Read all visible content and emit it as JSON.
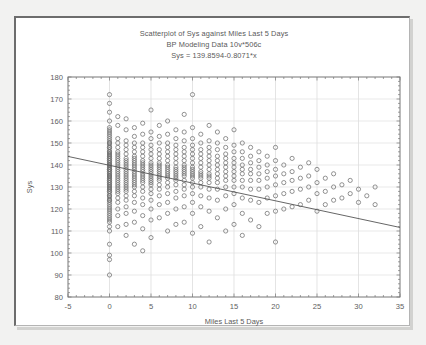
{
  "window": {
    "background_color": "#f2f2f1",
    "panel_color": "#ffffff",
    "border_color": "#6d6d6d"
  },
  "chart_data": {
    "type": "scatter",
    "title": "Scatterplot of Sys against Miles Last 5 Days",
    "subtitle": "BP Modeling Data 10v*506c",
    "equation": "Sys = 139.8594-0.8071*x",
    "xlabel": "Miles Last 5 Days",
    "ylabel": "Sys",
    "xlim": [
      -5,
      35
    ],
    "ylim": [
      80,
      180
    ],
    "xticks": [
      -5,
      0,
      5,
      10,
      15,
      20,
      25,
      30,
      35
    ],
    "yticks": [
      80,
      90,
      100,
      110,
      120,
      130,
      140,
      150,
      160,
      170,
      180
    ],
    "grid": true,
    "legend": "none",
    "marker": "open-circle",
    "marker_color": "#6f6f6f",
    "line_color": "#555555",
    "fit": {
      "intercept": 139.8594,
      "slope": -0.8071,
      "x_start": -5,
      "x_end": 35,
      "y_start": 143.894,
      "y_end": 111.61
    },
    "points": [
      [
        0,
        172
      ],
      [
        0,
        168
      ],
      [
        0,
        164
      ],
      [
        0,
        160
      ],
      [
        0,
        157
      ],
      [
        0,
        156
      ],
      [
        0,
        155
      ],
      [
        0,
        154
      ],
      [
        0,
        153
      ],
      [
        0,
        152
      ],
      [
        0,
        151
      ],
      [
        0,
        150
      ],
      [
        0,
        150
      ],
      [
        0,
        149
      ],
      [
        0,
        148
      ],
      [
        0,
        148
      ],
      [
        0,
        147
      ],
      [
        0,
        146
      ],
      [
        0,
        146
      ],
      [
        0,
        145
      ],
      [
        0,
        145
      ],
      [
        0,
        144
      ],
      [
        0,
        144
      ],
      [
        0,
        143
      ],
      [
        0,
        143
      ],
      [
        0,
        142
      ],
      [
        0,
        142
      ],
      [
        0,
        141
      ],
      [
        0,
        141
      ],
      [
        0,
        140
      ],
      [
        0,
        140
      ],
      [
        0,
        140
      ],
      [
        0,
        139
      ],
      [
        0,
        139
      ],
      [
        0,
        138
      ],
      [
        0,
        138
      ],
      [
        0,
        138
      ],
      [
        0,
        137
      ],
      [
        0,
        137
      ],
      [
        0,
        136
      ],
      [
        0,
        136
      ],
      [
        0,
        135
      ],
      [
        0,
        135
      ],
      [
        0,
        135
      ],
      [
        0,
        134
      ],
      [
        0,
        134
      ],
      [
        0,
        133
      ],
      [
        0,
        133
      ],
      [
        0,
        132
      ],
      [
        0,
        132
      ],
      [
        0,
        131
      ],
      [
        0,
        131
      ],
      [
        0,
        130
      ],
      [
        0,
        130
      ],
      [
        0,
        129
      ],
      [
        0,
        129
      ],
      [
        0,
        128
      ],
      [
        0,
        128
      ],
      [
        0,
        127
      ],
      [
        0,
        126
      ],
      [
        0,
        126
      ],
      [
        0,
        125
      ],
      [
        0,
        124
      ],
      [
        0,
        124
      ],
      [
        0,
        123
      ],
      [
        0,
        122
      ],
      [
        0,
        121
      ],
      [
        0,
        120
      ],
      [
        0,
        119
      ],
      [
        0,
        118
      ],
      [
        0,
        117
      ],
      [
        0,
        116
      ],
      [
        0,
        115
      ],
      [
        0,
        114
      ],
      [
        0,
        112
      ],
      [
        0,
        110
      ],
      [
        0,
        104
      ],
      [
        0,
        99
      ],
      [
        0,
        97
      ],
      [
        0,
        90
      ],
      [
        1,
        162
      ],
      [
        1,
        158
      ],
      [
        1,
        152
      ],
      [
        1,
        150
      ],
      [
        1,
        148
      ],
      [
        1,
        146
      ],
      [
        1,
        145
      ],
      [
        1,
        144
      ],
      [
        1,
        143
      ],
      [
        1,
        142
      ],
      [
        1,
        141
      ],
      [
        1,
        140
      ],
      [
        1,
        139
      ],
      [
        1,
        138
      ],
      [
        1,
        137
      ],
      [
        1,
        136
      ],
      [
        1,
        135
      ],
      [
        1,
        134
      ],
      [
        1,
        133
      ],
      [
        1,
        132
      ],
      [
        1,
        131
      ],
      [
        1,
        130
      ],
      [
        1,
        129
      ],
      [
        1,
        128
      ],
      [
        1,
        127
      ],
      [
        1,
        125
      ],
      [
        1,
        123
      ],
      [
        1,
        120
      ],
      [
        1,
        117
      ],
      [
        1,
        112
      ],
      [
        2,
        161
      ],
      [
        2,
        156
      ],
      [
        2,
        151
      ],
      [
        2,
        149
      ],
      [
        2,
        147
      ],
      [
        2,
        145
      ],
      [
        2,
        143
      ],
      [
        2,
        142
      ],
      [
        2,
        141
      ],
      [
        2,
        140
      ],
      [
        2,
        139
      ],
      [
        2,
        138
      ],
      [
        2,
        137
      ],
      [
        2,
        136
      ],
      [
        2,
        135
      ],
      [
        2,
        134
      ],
      [
        2,
        133
      ],
      [
        2,
        132
      ],
      [
        2,
        131
      ],
      [
        2,
        130
      ],
      [
        2,
        129
      ],
      [
        2,
        128
      ],
      [
        2,
        126
      ],
      [
        2,
        124
      ],
      [
        2,
        121
      ],
      [
        2,
        118
      ],
      [
        2,
        113
      ],
      [
        2,
        108
      ],
      [
        3,
        157
      ],
      [
        3,
        153
      ],
      [
        3,
        150
      ],
      [
        3,
        148
      ],
      [
        3,
        146
      ],
      [
        3,
        144
      ],
      [
        3,
        143
      ],
      [
        3,
        142
      ],
      [
        3,
        141
      ],
      [
        3,
        140
      ],
      [
        3,
        139
      ],
      [
        3,
        138
      ],
      [
        3,
        137
      ],
      [
        3,
        136
      ],
      [
        3,
        135
      ],
      [
        3,
        134
      ],
      [
        3,
        133
      ],
      [
        3,
        132
      ],
      [
        3,
        131
      ],
      [
        3,
        130
      ],
      [
        3,
        128
      ],
      [
        3,
        126
      ],
      [
        3,
        123
      ],
      [
        3,
        119
      ],
      [
        3,
        114
      ],
      [
        3,
        104
      ],
      [
        4,
        159
      ],
      [
        4,
        154
      ],
      [
        4,
        150
      ],
      [
        4,
        148
      ],
      [
        4,
        146
      ],
      [
        4,
        144
      ],
      [
        4,
        142
      ],
      [
        4,
        141
      ],
      [
        4,
        140
      ],
      [
        4,
        139
      ],
      [
        4,
        138
      ],
      [
        4,
        137
      ],
      [
        4,
        136
      ],
      [
        4,
        135
      ],
      [
        4,
        134
      ],
      [
        4,
        133
      ],
      [
        4,
        132
      ],
      [
        4,
        130
      ],
      [
        4,
        128
      ],
      [
        4,
        125
      ],
      [
        4,
        122
      ],
      [
        4,
        117
      ],
      [
        4,
        111
      ],
      [
        4,
        101
      ],
      [
        5,
        165
      ],
      [
        5,
        155
      ],
      [
        5,
        152
      ],
      [
        5,
        149
      ],
      [
        5,
        147
      ],
      [
        5,
        145
      ],
      [
        5,
        143
      ],
      [
        5,
        141
      ],
      [
        5,
        140
      ],
      [
        5,
        139
      ],
      [
        5,
        138
      ],
      [
        5,
        137
      ],
      [
        5,
        136
      ],
      [
        5,
        135
      ],
      [
        5,
        134
      ],
      [
        5,
        133
      ],
      [
        5,
        132
      ],
      [
        5,
        131
      ],
      [
        5,
        129
      ],
      [
        5,
        127
      ],
      [
        5,
        124
      ],
      [
        5,
        120
      ],
      [
        5,
        115
      ],
      [
        5,
        107
      ],
      [
        6,
        158
      ],
      [
        6,
        153
      ],
      [
        6,
        150
      ],
      [
        6,
        147
      ],
      [
        6,
        145
      ],
      [
        6,
        143
      ],
      [
        6,
        141
      ],
      [
        6,
        140
      ],
      [
        6,
        139
      ],
      [
        6,
        138
      ],
      [
        6,
        137
      ],
      [
        6,
        136
      ],
      [
        6,
        135
      ],
      [
        6,
        134
      ],
      [
        6,
        133
      ],
      [
        6,
        131
      ],
      [
        6,
        129
      ],
      [
        6,
        126
      ],
      [
        6,
        122
      ],
      [
        6,
        116
      ],
      [
        7,
        160
      ],
      [
        7,
        154
      ],
      [
        7,
        150
      ],
      [
        7,
        148
      ],
      [
        7,
        146
      ],
      [
        7,
        144
      ],
      [
        7,
        142
      ],
      [
        7,
        140
      ],
      [
        7,
        139
      ],
      [
        7,
        138
      ],
      [
        7,
        137
      ],
      [
        7,
        136
      ],
      [
        7,
        135
      ],
      [
        7,
        134
      ],
      [
        7,
        132
      ],
      [
        7,
        130
      ],
      [
        7,
        127
      ],
      [
        7,
        123
      ],
      [
        7,
        118
      ],
      [
        7,
        110
      ],
      [
        8,
        156
      ],
      [
        8,
        152
      ],
      [
        8,
        149
      ],
      [
        8,
        147
      ],
      [
        8,
        145
      ],
      [
        8,
        143
      ],
      [
        8,
        141
      ],
      [
        8,
        139
      ],
      [
        8,
        138
      ],
      [
        8,
        137
      ],
      [
        8,
        136
      ],
      [
        8,
        135
      ],
      [
        8,
        134
      ],
      [
        8,
        133
      ],
      [
        8,
        131
      ],
      [
        8,
        128
      ],
      [
        8,
        125
      ],
      [
        8,
        120
      ],
      [
        8,
        113
      ],
      [
        9,
        163
      ],
      [
        9,
        155
      ],
      [
        9,
        151
      ],
      [
        9,
        148
      ],
      [
        9,
        146
      ],
      [
        9,
        144
      ],
      [
        9,
        142
      ],
      [
        9,
        140
      ],
      [
        9,
        139
      ],
      [
        9,
        138
      ],
      [
        9,
        137
      ],
      [
        9,
        136
      ],
      [
        9,
        135
      ],
      [
        9,
        133
      ],
      [
        9,
        131
      ],
      [
        9,
        129
      ],
      [
        9,
        126
      ],
      [
        9,
        121
      ],
      [
        9,
        114
      ],
      [
        10,
        172
      ],
      [
        10,
        157
      ],
      [
        10,
        152
      ],
      [
        10,
        149
      ],
      [
        10,
        147
      ],
      [
        10,
        145
      ],
      [
        10,
        143
      ],
      [
        10,
        141
      ],
      [
        10,
        139
      ],
      [
        10,
        138
      ],
      [
        10,
        137
      ],
      [
        10,
        136
      ],
      [
        10,
        135
      ],
      [
        10,
        134
      ],
      [
        10,
        132
      ],
      [
        10,
        130
      ],
      [
        10,
        127
      ],
      [
        10,
        123
      ],
      [
        10,
        118
      ],
      [
        10,
        109
      ],
      [
        11,
        154
      ],
      [
        11,
        150
      ],
      [
        11,
        147
      ],
      [
        11,
        145
      ],
      [
        11,
        143
      ],
      [
        11,
        141
      ],
      [
        11,
        139
      ],
      [
        11,
        137
      ],
      [
        11,
        136
      ],
      [
        11,
        135
      ],
      [
        11,
        134
      ],
      [
        11,
        132
      ],
      [
        11,
        130
      ],
      [
        11,
        126
      ],
      [
        11,
        121
      ],
      [
        11,
        112
      ],
      [
        12,
        158
      ],
      [
        12,
        151
      ],
      [
        12,
        148
      ],
      [
        12,
        146
      ],
      [
        12,
        144
      ],
      [
        12,
        142
      ],
      [
        12,
        140
      ],
      [
        12,
        138
      ],
      [
        12,
        136
      ],
      [
        12,
        135
      ],
      [
        12,
        134
      ],
      [
        12,
        132
      ],
      [
        12,
        129
      ],
      [
        12,
        125
      ],
      [
        12,
        119
      ],
      [
        12,
        105
      ],
      [
        13,
        155
      ],
      [
        13,
        150
      ],
      [
        13,
        147
      ],
      [
        13,
        144
      ],
      [
        13,
        142
      ],
      [
        13,
        140
      ],
      [
        13,
        138
      ],
      [
        13,
        136
      ],
      [
        13,
        134
      ],
      [
        13,
        132
      ],
      [
        13,
        129
      ],
      [
        13,
        124
      ],
      [
        13,
        116
      ],
      [
        14,
        152
      ],
      [
        14,
        148
      ],
      [
        14,
        145
      ],
      [
        14,
        143
      ],
      [
        14,
        141
      ],
      [
        14,
        139
      ],
      [
        14,
        137
      ],
      [
        14,
        135
      ],
      [
        14,
        133
      ],
      [
        14,
        130
      ],
      [
        14,
        126
      ],
      [
        14,
        120
      ],
      [
        14,
        110
      ],
      [
        15,
        156
      ],
      [
        15,
        149
      ],
      [
        15,
        146
      ],
      [
        15,
        143
      ],
      [
        15,
        141
      ],
      [
        15,
        139
      ],
      [
        15,
        137
      ],
      [
        15,
        135
      ],
      [
        15,
        133
      ],
      [
        15,
        130
      ],
      [
        15,
        127
      ],
      [
        15,
        122
      ],
      [
        15,
        113
      ],
      [
        16,
        150
      ],
      [
        16,
        146
      ],
      [
        16,
        143
      ],
      [
        16,
        140
      ],
      [
        16,
        138
      ],
      [
        16,
        136
      ],
      [
        16,
        133
      ],
      [
        16,
        130
      ],
      [
        16,
        125
      ],
      [
        16,
        118
      ],
      [
        16,
        108
      ],
      [
        17,
        148
      ],
      [
        17,
        144
      ],
      [
        17,
        141
      ],
      [
        17,
        138
      ],
      [
        17,
        136
      ],
      [
        17,
        133
      ],
      [
        17,
        129
      ],
      [
        17,
        124
      ],
      [
        17,
        115
      ],
      [
        18,
        146
      ],
      [
        18,
        142
      ],
      [
        18,
        139
      ],
      [
        18,
        136
      ],
      [
        18,
        133
      ],
      [
        18,
        129
      ],
      [
        18,
        123
      ],
      [
        18,
        112
      ],
      [
        19,
        144
      ],
      [
        19,
        140
      ],
      [
        19,
        137
      ],
      [
        19,
        134
      ],
      [
        19,
        130
      ],
      [
        19,
        125
      ],
      [
        19,
        118
      ],
      [
        20,
        148
      ],
      [
        20,
        142
      ],
      [
        20,
        138
      ],
      [
        20,
        135
      ],
      [
        20,
        131
      ],
      [
        20,
        126
      ],
      [
        20,
        119
      ],
      [
        20,
        105
      ],
      [
        21,
        140
      ],
      [
        21,
        136
      ],
      [
        21,
        132
      ],
      [
        21,
        127
      ],
      [
        21,
        120
      ],
      [
        22,
        143
      ],
      [
        22,
        137
      ],
      [
        22,
        133
      ],
      [
        22,
        128
      ],
      [
        22,
        121
      ],
      [
        23,
        139
      ],
      [
        23,
        134
      ],
      [
        23,
        129
      ],
      [
        23,
        122
      ],
      [
        24,
        141
      ],
      [
        24,
        135
      ],
      [
        24,
        130
      ],
      [
        24,
        124
      ],
      [
        25,
        138
      ],
      [
        25,
        132
      ],
      [
        25,
        127
      ],
      [
        25,
        119
      ],
      [
        26,
        134
      ],
      [
        26,
        128
      ],
      [
        26,
        122
      ],
      [
        27,
        136
      ],
      [
        27,
        130
      ],
      [
        27,
        124
      ],
      [
        28,
        131
      ],
      [
        28,
        125
      ],
      [
        29,
        133
      ],
      [
        29,
        127
      ],
      [
        30,
        129
      ],
      [
        30,
        123
      ],
      [
        31,
        126
      ],
      [
        32,
        130
      ],
      [
        32,
        122
      ]
    ]
  }
}
